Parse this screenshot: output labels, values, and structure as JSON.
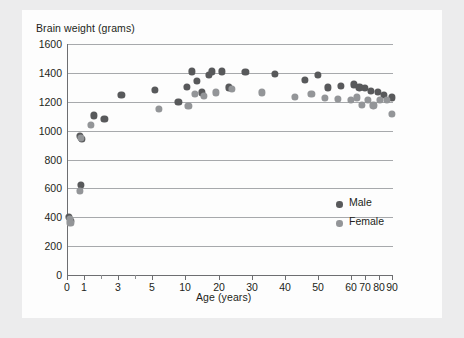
{
  "figure": {
    "background_color": "#ececed",
    "panel_color": "#fdfdfd"
  },
  "legend": {
    "position": "inside-right",
    "items": [
      {
        "label": "Male",
        "color": "#58595b"
      },
      {
        "label": "Female",
        "color": "#939598"
      }
    ]
  },
  "chart_data": {
    "type": "scatter",
    "title": "",
    "ylabel": "Brain weight (grams)",
    "xlabel": "Age (years)",
    "ylim": [
      0,
      1600
    ],
    "ytick_labels": [
      "0",
      "200",
      "400",
      "600",
      "800",
      "1000",
      "1200",
      "1400",
      "1600"
    ],
    "ytick_values": [
      0,
      200,
      400,
      600,
      800,
      1000,
      1200,
      1400,
      1600
    ],
    "xtick_labels": [
      "0",
      "1",
      "3",
      "5",
      "10",
      "20",
      "30",
      "40",
      "50",
      "60",
      "70",
      "80",
      "90"
    ],
    "xtick_values": [
      0,
      1,
      3,
      5,
      10,
      20,
      30,
      40,
      50,
      60,
      70,
      80,
      90
    ],
    "x_scale": "compressed-nonlinear",
    "grid": "horizontal",
    "legend_position": "inside-right",
    "series": [
      {
        "name": "Male",
        "color": "#58595b",
        "points": [
          {
            "x": 0.1,
            "y": 400
          },
          {
            "x": 0.25,
            "y": 375
          },
          {
            "x": 0.8,
            "y": 625
          },
          {
            "x": 0.75,
            "y": 965
          },
          {
            "x": 0.9,
            "y": 945
          },
          {
            "x": 1.6,
            "y": 1105
          },
          {
            "x": 2.2,
            "y": 1080
          },
          {
            "x": 3.2,
            "y": 1250
          },
          {
            "x": 5.5,
            "y": 1280
          },
          {
            "x": 9,
            "y": 1200
          },
          {
            "x": 10.5,
            "y": 1305
          },
          {
            "x": 12,
            "y": 1410
          },
          {
            "x": 13.5,
            "y": 1345
          },
          {
            "x": 15,
            "y": 1265
          },
          {
            "x": 17,
            "y": 1385
          },
          {
            "x": 18,
            "y": 1410
          },
          {
            "x": 21,
            "y": 1410
          },
          {
            "x": 23,
            "y": 1300
          },
          {
            "x": 28,
            "y": 1405
          },
          {
            "x": 37,
            "y": 1395
          },
          {
            "x": 46,
            "y": 1350
          },
          {
            "x": 50,
            "y": 1385
          },
          {
            "x": 53,
            "y": 1300
          },
          {
            "x": 57,
            "y": 1310
          },
          {
            "x": 62,
            "y": 1320
          },
          {
            "x": 66,
            "y": 1300
          },
          {
            "x": 70,
            "y": 1295
          },
          {
            "x": 74,
            "y": 1275
          },
          {
            "x": 79,
            "y": 1270
          },
          {
            "x": 84,
            "y": 1245
          },
          {
            "x": 90,
            "y": 1230
          }
        ]
      },
      {
        "name": "Female",
        "color": "#939598",
        "points": [
          {
            "x": 0.15,
            "y": 385
          },
          {
            "x": 0.2,
            "y": 360
          },
          {
            "x": 0.75,
            "y": 580
          },
          {
            "x": 0.8,
            "y": 950
          },
          {
            "x": 1.4,
            "y": 1040
          },
          {
            "x": 6,
            "y": 1150
          },
          {
            "x": 11,
            "y": 1170
          },
          {
            "x": 13,
            "y": 1255
          },
          {
            "x": 15.5,
            "y": 1240
          },
          {
            "x": 19,
            "y": 1265
          },
          {
            "x": 24,
            "y": 1290
          },
          {
            "x": 33,
            "y": 1265
          },
          {
            "x": 43,
            "y": 1235
          },
          {
            "x": 48,
            "y": 1255
          },
          {
            "x": 52,
            "y": 1225
          },
          {
            "x": 56,
            "y": 1220
          },
          {
            "x": 60,
            "y": 1215
          },
          {
            "x": 64,
            "y": 1230
          },
          {
            "x": 68,
            "y": 1180
          },
          {
            "x": 72,
            "y": 1215
          },
          {
            "x": 76,
            "y": 1175
          },
          {
            "x": 81,
            "y": 1215
          },
          {
            "x": 86,
            "y": 1215
          },
          {
            "x": 90,
            "y": 1115
          }
        ]
      }
    ]
  }
}
